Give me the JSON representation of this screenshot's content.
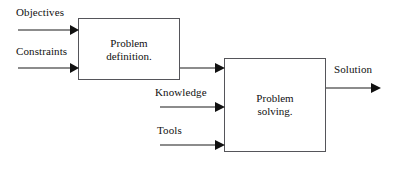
{
  "diagram": {
    "type": "flowchart",
    "canvas": {
      "width": 398,
      "height": 171,
      "background": "#ffffff"
    },
    "stroke_color": "#1a1a1a",
    "box_border_color": "#55555a",
    "nodes": [
      {
        "id": "problem-definition",
        "label": "Problem\ndefinition.",
        "x": 78,
        "y": 18,
        "width": 102,
        "height": 62
      },
      {
        "id": "problem-solving",
        "label": "Problem\nsolving.",
        "x": 224,
        "y": 58,
        "width": 102,
        "height": 94
      }
    ],
    "inputs": [
      {
        "id": "objectives",
        "label": "Objectives",
        "label_x": 16,
        "label_y": 6,
        "line_y": 30,
        "line_x1": 18,
        "line_x2": 78
      },
      {
        "id": "constraints",
        "label": "Constraints",
        "label_x": 16,
        "label_y": 45,
        "line_y": 68,
        "line_x1": 18,
        "line_x2": 78
      },
      {
        "id": "knowledge",
        "label": "Knowledge",
        "label_x": 155,
        "label_y": 86,
        "line_y": 107,
        "line_x1": 160,
        "line_x2": 224
      },
      {
        "id": "tools",
        "label": "Tools",
        "label_x": 157,
        "label_y": 124,
        "line_y": 145,
        "line_x1": 160,
        "line_x2": 224
      }
    ],
    "connector": {
      "id": "definition-to-solving",
      "label": "",
      "line_y": 68,
      "line_x1": 180,
      "line_x2": 224
    },
    "output": {
      "id": "solution",
      "label": "Solution",
      "label_x": 334,
      "label_y": 63,
      "line_y": 88,
      "line_x1": 326,
      "line_x2": 380
    }
  }
}
